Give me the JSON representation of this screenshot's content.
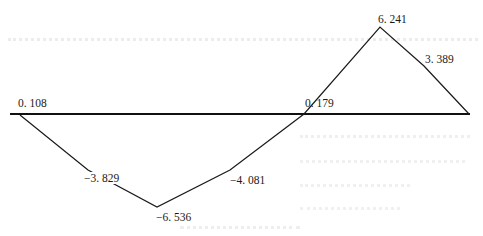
{
  "diagram": {
    "type": "internal-force-diagram",
    "baseline": {
      "x1": 10,
      "x2": 470,
      "y": 114
    },
    "line_color": "#1a1a1a",
    "points": [
      {
        "x": 20,
        "y": 115
      },
      {
        "x": 88,
        "y": 170
      },
      {
        "x": 157,
        "y": 207
      },
      {
        "x": 230,
        "y": 170
      },
      {
        "x": 304,
        "y": 114
      },
      {
        "x": 380,
        "y": 27
      },
      {
        "x": 424,
        "y": 66
      },
      {
        "x": 469,
        "y": 114
      }
    ],
    "labels": [
      {
        "id": "start",
        "text": "0. 108",
        "x": 18,
        "y": 97
      },
      {
        "id": "kink1",
        "text": "−3. 829",
        "x": 83,
        "y": 172
      },
      {
        "id": "min",
        "text": "−6. 536",
        "x": 156,
        "y": 211
      },
      {
        "id": "kink2",
        "text": "−4. 081",
        "x": 230,
        "y": 174
      },
      {
        "id": "cross",
        "text": "0. 179",
        "x": 305,
        "y": 97
      },
      {
        "id": "peak",
        "text": "6. 241",
        "x": 378,
        "y": 13
      },
      {
        "id": "kink3",
        "text": "3. 389",
        "x": 425,
        "y": 53
      }
    ]
  },
  "chart_data": {
    "type": "line",
    "title": "",
    "xlabel": "",
    "ylabel": "",
    "x": [
      0,
      1,
      2,
      3,
      4,
      5,
      6,
      7
    ],
    "series": [
      {
        "name": "force",
        "values": [
          0.108,
          -3.829,
          -6.536,
          -4.081,
          0.179,
          6.241,
          3.389,
          0
        ]
      }
    ],
    "annotations": [
      "0. 108",
      "-3. 829",
      "-6. 536",
      "-4. 081",
      "0. 179",
      "6. 241",
      "3. 389"
    ],
    "grid": false
  }
}
